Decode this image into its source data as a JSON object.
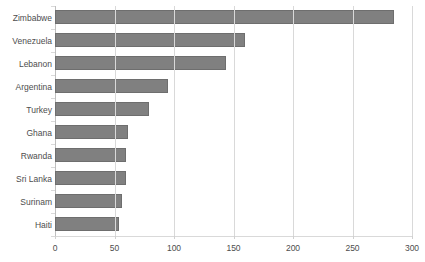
{
  "chart_data": {
    "type": "bar",
    "orientation": "horizontal",
    "title": "",
    "xlabel": "",
    "ylabel": "",
    "categories": [
      "Zimbabwe",
      "Venezuela",
      "Lebanon",
      "Argentina",
      "Turkey",
      "Ghana",
      "Rwanda",
      "Sri Lanka",
      "Surinam",
      "Haiti"
    ],
    "values": [
      285,
      160,
      144,
      95,
      79,
      61,
      60,
      60,
      56,
      54
    ],
    "xlim": [
      0,
      300
    ],
    "xticks": [
      0,
      50,
      100,
      150,
      200,
      250,
      300
    ],
    "xtick_labels": [
      "0",
      "50",
      "100",
      "150",
      "200",
      "250",
      "300"
    ],
    "grid": "vertical",
    "legend": "none",
    "bar_color": "#808080",
    "bar_border_color": "#6e6e6e",
    "gridline_color": "#d9d9d9",
    "label_color": "#4d4d4d",
    "background": "#ffffff"
  }
}
